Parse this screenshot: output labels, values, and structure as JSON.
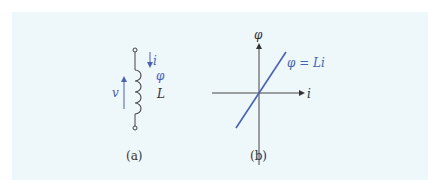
{
  "figure": {
    "panel_a": {
      "caption": "(a)",
      "labels": {
        "current": "i",
        "flux": "φ",
        "inductance": "L",
        "voltage": "v"
      }
    },
    "panel_b": {
      "caption": "(b)",
      "y_axis_label": "φ",
      "x_axis_label": "i",
      "line_label": "φ = Li"
    },
    "colors": {
      "background": "#eef7f9",
      "accent_blue": "#4a62b0",
      "ink": "#333333"
    }
  }
}
